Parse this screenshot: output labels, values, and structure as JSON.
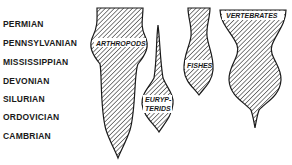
{
  "periods": [
    {
      "name": "PERMIAN",
      "y": 19
    },
    {
      "name": "PENNSYLVANIAN",
      "y": 38
    },
    {
      "name": "MISSISSIPPIAN",
      "y": 57
    },
    {
      "name": "DEVONIAN",
      "y": 76
    },
    {
      "name": "SILURIAN",
      "y": 94
    },
    {
      "name": "ORDOVICIAN",
      "y": 112
    },
    {
      "name": "CAMBRIAN",
      "y": 131
    }
  ],
  "groups": {
    "arthropods": "ARTHROPODS",
    "eurypterids_1": "EURYP-",
    "eurypterids_2": "TERIDS",
    "fishes": "FISHES",
    "vertebrates": "VERTEBRATES"
  },
  "colors": {
    "ink": "#1a1a1a",
    "background": "#ffffff"
  }
}
